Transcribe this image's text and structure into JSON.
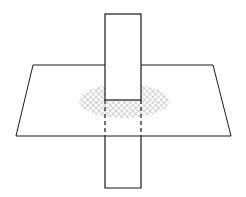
{
  "diagram": {
    "colors": {
      "background": "#ffffff",
      "stroke": "#1a1a1a",
      "hatch": "#777777"
    },
    "plane": {
      "points": [
        [
          33,
          65
        ],
        [
          213,
          65
        ],
        [
          231,
          136
        ],
        [
          16,
          136
        ]
      ]
    },
    "ellipse": {
      "cx": 124,
      "cy": 101,
      "rx": 45,
      "ry": 17
    },
    "bar": {
      "left": 105,
      "right": 141,
      "top": 14,
      "bottom": 188,
      "plane_entry_y": 100,
      "plane_exit_y": 136
    }
  }
}
